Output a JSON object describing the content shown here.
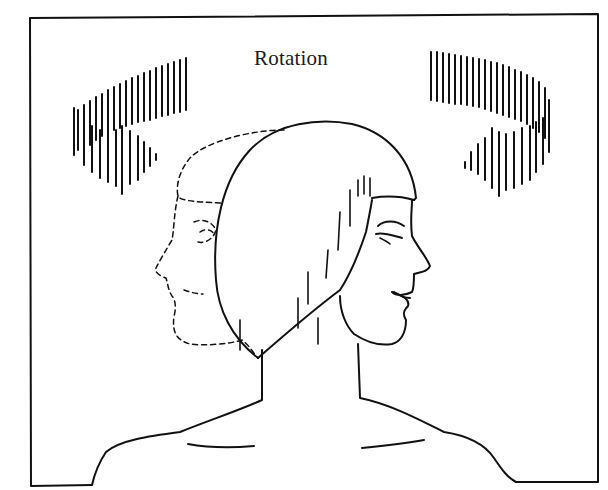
{
  "figure": {
    "title": "Rotation",
    "colors": {
      "ink": "#111111",
      "background": "#ffffff"
    }
  }
}
